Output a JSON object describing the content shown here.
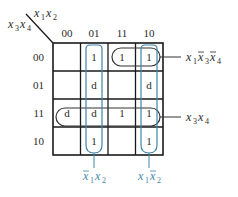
{
  "kmap": {
    "row_var_label": "x3x4",
    "col_var_label": "x1x2",
    "column_headers": [
      "00",
      "01",
      "11",
      "10"
    ],
    "row_headers": [
      "00",
      "01",
      "11",
      "10"
    ],
    "cells": [
      [
        "",
        "1",
        "1",
        "1"
      ],
      [
        "",
        "d",
        "",
        "d"
      ],
      [
        "d",
        "d",
        "1",
        "1"
      ],
      [
        "",
        "1",
        "",
        "1"
      ]
    ],
    "groups": [
      {
        "label": "x1 x̄3 x̄4",
        "color": "#333333"
      },
      {
        "label": "x3 x4",
        "color": "#333333"
      },
      {
        "label": "x̄1 x2",
        "color": "#3f86a6"
      },
      {
        "label": "x1 x̄2",
        "color": "#3f86a6"
      }
    ]
  },
  "colors": {
    "grid": "#1a1a1a",
    "loop_dark": "#333333",
    "loop_blue": "#3f86a6",
    "text": "#2a2a2a"
  }
}
